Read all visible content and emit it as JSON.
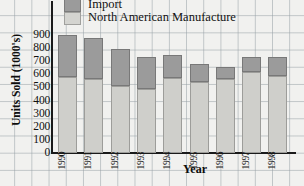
{
  "chart_data": {
    "type": "bar",
    "subtype": "stacked-vertical",
    "title": "",
    "xlabel": "Year",
    "ylabel": "Units Sold (1000's)",
    "categories": [
      "1990",
      "1991",
      "1992",
      "1993",
      "1994",
      "1995",
      "1996",
      "1997",
      "1998"
    ],
    "series": [
      {
        "name": "North American Manufacture",
        "color": "#cfcfcb",
        "values": [
          580,
          565,
          510,
          490,
          575,
          540,
          565,
          620,
          585
        ]
      },
      {
        "name": "Import",
        "color": "#9b9b9b",
        "values": [
          320,
          310,
          285,
          240,
          175,
          140,
          90,
          115,
          150
        ]
      }
    ],
    "totals": [
      900,
      875,
      795,
      730,
      750,
      680,
      655,
      735,
      735
    ],
    "ylim": [
      0,
      900
    ],
    "ytick_values": [
      0,
      100,
      200,
      300,
      400,
      500,
      600,
      700,
      800,
      900
    ],
    "ytick_labels": [
      "0",
      "100",
      "200",
      "300",
      "400",
      "500",
      "600",
      "700",
      "800",
      "900"
    ],
    "grid": "graph-paper-background",
    "legend_position": "top-left",
    "legend": [
      {
        "label": "Import",
        "color": "#9b9b9b"
      },
      {
        "label": "North American Manufacture",
        "color": "#cfcfcb"
      }
    ]
  },
  "axes": {
    "y_title": "Units Sold (1000's)",
    "x_title": "Year"
  }
}
